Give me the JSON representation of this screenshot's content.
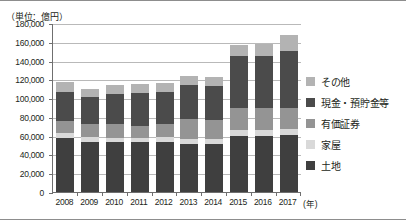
{
  "chart_data": {
    "type": "bar",
    "subtype": "stacked-column",
    "title": "",
    "unit_label": "（単位：億円）",
    "xlabel": "(年)",
    "ylabel": "",
    "ylim": [
      0,
      180000
    ],
    "ytick_step": 20000,
    "yticks": [
      "0",
      "20,000",
      "40,000",
      "60,000",
      "80,000",
      "100,000",
      "120,000",
      "140,000",
      "160,000",
      "180,000"
    ],
    "grid": true,
    "legend_position": "right",
    "categories": [
      "2008",
      "2009",
      "2010",
      "2011",
      "2012",
      "2013",
      "2014",
      "2015",
      "2016",
      "2017"
    ],
    "series": [
      {
        "name": "土地",
        "color": "#3f3f3f",
        "values": [
          58000,
          53500,
          53000,
          53000,
          53000,
          51500,
          51500,
          60000,
          60000,
          60500
        ]
      },
      {
        "name": "家屋",
        "color": "#d9d9d9",
        "values": [
          5000,
          5000,
          5000,
          5000,
          5500,
          5500,
          5500,
          6500,
          6500,
          6500
        ]
      },
      {
        "name": "有価証券",
        "color": "#949494",
        "values": [
          12500,
          13500,
          14500,
          12500,
          14000,
          20500,
          20000,
          23000,
          22500,
          23000
        ]
      },
      {
        "name": "現金・預貯金等",
        "color": "#4b4b4b",
        "values": [
          31000,
          29500,
          31500,
          34500,
          34500,
          36000,
          35500,
          55000,
          56000,
          60000
        ]
      },
      {
        "name": "その他",
        "color": "#b3b3b3",
        "values": [
          10500,
          8500,
          9500,
          10500,
          9500,
          10500,
          10000,
          12500,
          13000,
          17000
        ]
      }
    ],
    "totals": [
      117000,
      110000,
      113500,
      115500,
      116500,
      124000,
      122500,
      157000,
      158000,
      167000
    ],
    "legend_entries": [
      {
        "label": "その他",
        "color": "#b3b3b3"
      },
      {
        "label": "現金・預貯金等",
        "color": "#4b4b4b"
      },
      {
        "label": "有価証券",
        "color": "#949494"
      },
      {
        "label": "家屋",
        "color": "#d9d9d9"
      },
      {
        "label": "土地",
        "color": "#3f3f3f"
      }
    ]
  }
}
